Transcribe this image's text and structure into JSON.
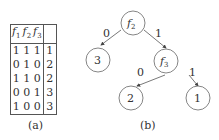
{
  "figure_a": {
    "caption": "(a)",
    "headers": [
      "f",
      "f",
      "f",
      ""
    ],
    "header_subs": [
      "1",
      "2",
      "3"
    ],
    "rows": [
      [
        "1",
        "1",
        "1",
        "1"
      ],
      [
        "0",
        "1",
        "0",
        "2"
      ],
      [
        "1",
        "1",
        "0",
        "2"
      ],
      [
        "0",
        "0",
        "1",
        "3"
      ],
      [
        "1",
        "0",
        "0",
        "3"
      ]
    ]
  },
  "figure_b": {
    "caption": "(b)",
    "nodes": {
      "root": {
        "label": "f",
        "sub": "2"
      },
      "left_leaf": {
        "label": "3"
      },
      "inner": {
        "label": "f",
        "sub": "3"
      },
      "inner_left_leaf": {
        "label": "2"
      },
      "inner_right_leaf": {
        "label": "1"
      }
    },
    "edges": {
      "root_left": "0",
      "root_right": "1",
      "inner_left": "0",
      "inner_right": "1"
    }
  }
}
